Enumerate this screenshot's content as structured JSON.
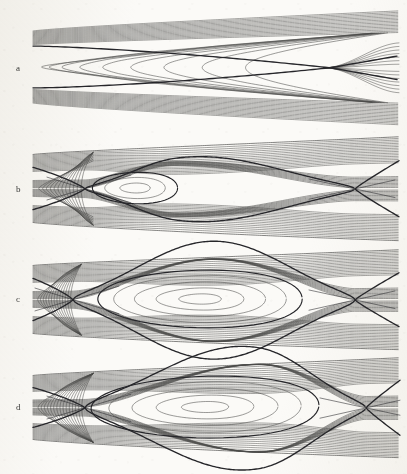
{
  "figure": {
    "background_color": "#fbfaf7",
    "line_color": "#4a4a48",
    "separatrix_color": "#26262a",
    "width": 407,
    "height": 474,
    "caption": ""
  },
  "panels": [
    {
      "label": "a",
      "label_x": 16,
      "label_y": 69,
      "top": 8,
      "height": 118,
      "left_x": 33,
      "right_x": 400,
      "left_half_height": 36,
      "right_half_height": 57,
      "axis_y": 67,
      "island": null,
      "x_points": [
        {
          "x": 330,
          "y": 70
        }
      ],
      "separatrix_count": 2,
      "streamline_count": 44,
      "description": "converging wedge flow, single downstream saddle point, no closed island"
    },
    {
      "label": "b",
      "label_x": 16,
      "label_y": 190,
      "top": 136,
      "height": 112,
      "left_x": 33,
      "right_x": 400,
      "left_half_height": 34,
      "right_half_height": 52,
      "axis_y": 188,
      "island": {
        "center_x": 135,
        "center_y": 188,
        "rx": 52,
        "ry": 16
      },
      "x_points": [
        {
          "x": 85,
          "y": 190
        },
        {
          "x": 355,
          "y": 186
        }
      ],
      "separatrix_count": 2,
      "streamline_count": 42,
      "description": "small closed vortex island between two saddle points"
    },
    {
      "label": "c",
      "label_x": 16,
      "label_y": 300,
      "top": 250,
      "height": 110,
      "left_x": 33,
      "right_x": 400,
      "left_half_height": 34,
      "right_half_height": 50,
      "axis_y": 299,
      "island": {
        "center_x": 200,
        "center_y": 299,
        "rx": 120,
        "ry": 28
      },
      "x_points": [
        {
          "x": 73,
          "y": 300
        },
        {
          "x": 355,
          "y": 298
        }
      ],
      "separatrix_count": 2,
      "streamline_count": 42,
      "description": "large symmetric vortex island spanning most of the domain"
    },
    {
      "label": "d",
      "label_x": 16,
      "label_y": 408,
      "top": 358,
      "height": 112,
      "left_x": 33,
      "right_x": 400,
      "left_half_height": 32,
      "right_half_height": 50,
      "axis_y": 407,
      "island": {
        "center_x": 205,
        "center_y": 407,
        "rx": 130,
        "ry": 30
      },
      "x_points": [
        {
          "x": 85,
          "y": 410
        },
        {
          "x": 366,
          "y": 405
        }
      ],
      "separatrix_count": 2,
      "streamline_count": 42,
      "description": "asymmetric island with pinched upstream neck, saddle near right edge"
    }
  ],
  "chart_data": {
    "type": "line",
    "title": "",
    "xlabel": "",
    "ylabel": "",
    "grid": false,
    "legend": null,
    "series": [
      {
        "name": "panel-a-streamlines",
        "n_lines": 44,
        "closed_orbits": 0,
        "saddles": 1
      },
      {
        "name": "panel-b-streamlines",
        "n_lines": 42,
        "closed_orbits": 3,
        "saddles": 2
      },
      {
        "name": "panel-c-streamlines",
        "n_lines": 42,
        "closed_orbits": 5,
        "saddles": 2
      },
      {
        "name": "panel-d-streamlines",
        "n_lines": 42,
        "closed_orbits": 5,
        "saddles": 2
      }
    ]
  }
}
